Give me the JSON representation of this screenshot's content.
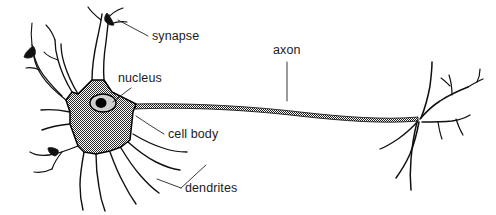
{
  "figure": {
    "background_color": "#ffffff",
    "ink_color": "#101010",
    "soma_fill_color": "#8a8a8a",
    "nucleus_fill_color": "#cfcfcf",
    "nucleolus_color": "#000000"
  },
  "labels": {
    "synapse": "synapse",
    "nucleus": "nucleus",
    "axon": "axon",
    "cell_body": "cell body",
    "dendrites": "dendrites"
  },
  "parts": [
    {
      "key": "synapse",
      "label": "synapse",
      "x": 152,
      "y": 40,
      "points_to": "dendritic terminal bouton, top of cell"
    },
    {
      "key": "nucleus",
      "label": "nucleus",
      "x": 118,
      "y": 82,
      "points_to": "oval nucleus inside cell body"
    },
    {
      "key": "axon",
      "label": "axon",
      "x": 273,
      "y": 54,
      "points_to": "long stippled fiber extending right"
    },
    {
      "key": "cell_body",
      "label": "cell body",
      "x": 168,
      "y": 138,
      "points_to": "shaded star-shaped soma"
    },
    {
      "key": "dendrites",
      "label": "dendrites",
      "x": 185,
      "y": 192,
      "points_to": "branching processes below soma"
    }
  ]
}
